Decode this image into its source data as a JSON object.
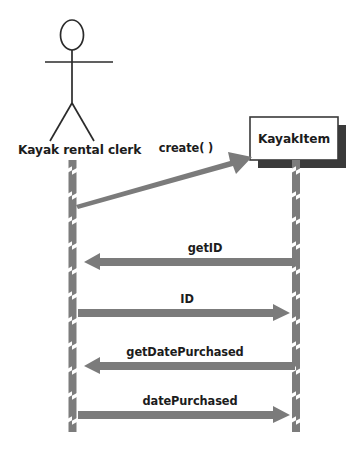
{
  "diagram": {
    "kind": "uml-sequence-diagram",
    "colors": {
      "background": "#ffffff",
      "text": "#1c1c1c",
      "stroke": "#2b2b2b",
      "lifeline_fill": "#7c7c7c",
      "lifeline_notch": "#ffffff",
      "arrow_fill": "#7b7b7b",
      "box_fill": "#ffffff",
      "box_border": "#3a3a3a",
      "box_shadow": "#3a3a3a"
    },
    "participants": [
      {
        "id": "actor",
        "name": "Kayak rental clerk",
        "type": "actor",
        "icon": "stick-figure-icon",
        "label_x": 18,
        "label_y": 154,
        "lifeline_x": 72,
        "lifeline_top": 160,
        "lifeline_bottom": 432
      },
      {
        "id": "kayakitem",
        "name": "KayakItem",
        "type": "object",
        "label_x": 294,
        "label_y": 143,
        "lifeline_x": 296,
        "lifeline_top": 160,
        "lifeline_bottom": 432,
        "box": {
          "x": 250,
          "y": 117,
          "width": 88,
          "height": 43
        }
      }
    ],
    "messages": [
      {
        "index": 1,
        "label": "create( )",
        "from": "actor",
        "to": "kayakitem",
        "direction": "right",
        "style": "diagonal-create",
        "label_x": 186,
        "label_y": 152,
        "x1": 76,
        "y1": 201,
        "x2": 250,
        "y2": 152
      },
      {
        "index": 2,
        "label": "getID",
        "from": "kayakitem",
        "to": "actor",
        "direction": "left",
        "style": "horizontal",
        "label_x": 205,
        "label_y": 252,
        "y": 262
      },
      {
        "index": 3,
        "label": "ID",
        "from": "actor",
        "to": "kayakitem",
        "direction": "right",
        "style": "horizontal",
        "label_x": 187,
        "label_y": 303,
        "y": 313
      },
      {
        "index": 4,
        "label": "getDatePurchased",
        "from": "kayakitem",
        "to": "actor",
        "direction": "left",
        "style": "horizontal",
        "label_x": 185,
        "label_y": 356,
        "y": 366
      },
      {
        "index": 5,
        "label": "datePurchased",
        "from": "actor",
        "to": "kayakitem",
        "direction": "right",
        "style": "horizontal",
        "label_x": 190,
        "label_y": 405,
        "y": 415
      }
    ],
    "actor_figure": {
      "head": {
        "cx": 72,
        "cy": 35,
        "rx": 11.5,
        "ry": 15
      },
      "arms": {
        "x1": 45,
        "y1": 62,
        "x2": 113,
        "y2": 62
      },
      "spine": {
        "x1": 72,
        "y1": 50,
        "x2": 72,
        "y2": 103
      },
      "leg_left": {
        "x1": 72,
        "y1": 103,
        "x2": 50,
        "y2": 141
      },
      "leg_right": {
        "x1": 72,
        "y1": 103,
        "x2": 94,
        "y2": 141
      }
    }
  }
}
